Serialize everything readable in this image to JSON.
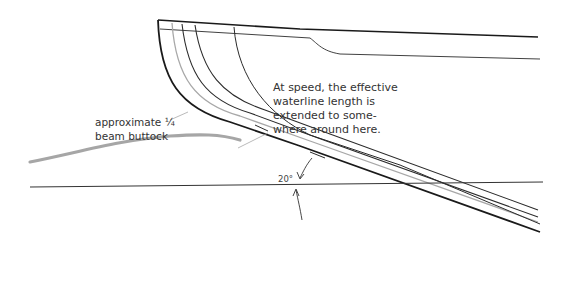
{
  "diagram": {
    "callout": {
      "lines": [
        "At speed, the effective",
        "waterline length is",
        "extended to some-",
        "where around here."
      ]
    },
    "buttock_label": {
      "lines": [
        "approximate ¼",
        "beam buttock"
      ]
    },
    "angle_label": "20°",
    "colors": {
      "hull_line": "#1a1a1a",
      "section_line": "#2b2b2b",
      "buttock_line": "#a8a8a8",
      "text": "#333333",
      "background": "#ffffff"
    }
  }
}
